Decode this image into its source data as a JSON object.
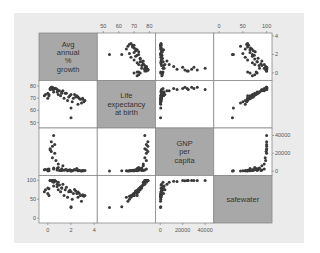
{
  "chart_data": {
    "type": "scatter",
    "subtype": "scatterplot-matrix",
    "title": "",
    "variables": [
      {
        "name": "Avg annual % growth",
        "label_lines": [
          "Avg",
          "annual",
          "%",
          "growth"
        ],
        "range": [
          -0.5,
          4
        ],
        "ticks": [
          0,
          2,
          4
        ]
      },
      {
        "name": "Life expectancy at birth",
        "label_lines": [
          "Life",
          "expectancy",
          "at birth"
        ],
        "range": [
          48,
          82
        ],
        "ticks": [
          50,
          60,
          70,
          80
        ]
      },
      {
        "name": "GNP per capita",
        "label_lines": [
          "GNP",
          "per",
          "capita"
        ],
        "range": [
          -1500,
          45000
        ],
        "ticks": [
          0,
          20000,
          40000
        ]
      },
      {
        "name": "safewater",
        "label_lines": [
          "safewater"
        ],
        "range": [
          -5,
          105
        ],
        "ticks": [
          0,
          50,
          100
        ]
      }
    ],
    "axes": {
      "top": [
        {
          "col": 1,
          "ticks": [
            "50",
            "60",
            "70",
            "80"
          ]
        },
        {
          "col": 3,
          "ticks": [
            "0",
            "50",
            "100"
          ]
        }
      ],
      "bottom": [
        {
          "col": 0,
          "ticks": [
            "0",
            "2",
            "4"
          ]
        },
        {
          "col": 2,
          "ticks": [
            "0",
            "20000",
            "40000"
          ]
        }
      ],
      "left": [
        {
          "row": 1,
          "ticks": [
            "80",
            "70",
            "60",
            "50"
          ]
        },
        {
          "row": 3,
          "ticks": [
            "100",
            "50",
            "0"
          ]
        }
      ],
      "right": [
        {
          "row": 0,
          "ticks": [
            "4",
            "2",
            "0"
          ]
        },
        {
          "row": 2,
          "ticks": [
            "40000",
            "20000",
            "0"
          ]
        }
      ]
    },
    "points": [
      [
        0.5,
        78,
        2500,
        95
      ],
      [
        0.8,
        77,
        1200,
        90
      ],
      [
        1.0,
        76,
        800,
        88
      ],
      [
        0.3,
        79,
        22000,
        99
      ],
      [
        0.6,
        78,
        30000,
        100
      ],
      [
        0.2,
        77,
        25000,
        100
      ],
      [
        0.4,
        79,
        28000,
        100
      ],
      [
        1.2,
        75,
        700,
        80
      ],
      [
        1.5,
        74,
        1500,
        75
      ],
      [
        2.0,
        73,
        1000,
        70
      ],
      [
        2.5,
        72,
        3000,
        65
      ],
      [
        3.0,
        70,
        400,
        60
      ],
      [
        2.8,
        69,
        600,
        60
      ],
      [
        2.2,
        70,
        900,
        65
      ],
      [
        1.8,
        71,
        1100,
        70
      ],
      [
        0.1,
        72,
        500,
        60
      ],
      [
        -0.2,
        73,
        1800,
        75
      ],
      [
        0.0,
        74,
        2200,
        80
      ],
      [
        0.5,
        75,
        3500,
        85
      ],
      [
        0.9,
        73,
        4200,
        75
      ],
      [
        1.1,
        72,
        700,
        70
      ],
      [
        1.4,
        70,
        900,
        60
      ],
      [
        1.7,
        68,
        600,
        55
      ],
      [
        2.1,
        67,
        500,
        50
      ],
      [
        2.6,
        65,
        400,
        55
      ],
      [
        2.9,
        66,
        300,
        45
      ],
      [
        3.2,
        68,
        800,
        60
      ],
      [
        2.0,
        62,
        500,
        30
      ],
      [
        2.0,
        54,
        300,
        28
      ],
      [
        1.3,
        76,
        6000,
        90
      ],
      [
        0.7,
        78,
        12000,
        98
      ],
      [
        0.4,
        77,
        15000,
        97
      ],
      [
        0.6,
        78,
        20000,
        100
      ],
      [
        0.2,
        78,
        24000,
        100
      ],
      [
        0.3,
        79,
        33000,
        100
      ],
      [
        0.5,
        77,
        40000,
        100
      ],
      [
        0.9,
        76,
        8000,
        95
      ],
      [
        1.6,
        74,
        2000,
        82
      ],
      [
        2.4,
        71,
        1200,
        72
      ],
      [
        2.7,
        70,
        900,
        66
      ],
      [
        3.0,
        69,
        700,
        62
      ],
      [
        3.1,
        67,
        600,
        58
      ],
      [
        0.0,
        70,
        500,
        65
      ],
      [
        -0.3,
        72,
        1500,
        70
      ],
      [
        0.1,
        73,
        2500,
        78
      ],
      [
        0.8,
        75,
        3000,
        84
      ],
      [
        1.2,
        74,
        2700,
        80
      ],
      [
        1.9,
        72,
        1600,
        74
      ],
      [
        2.3,
        73,
        1900,
        76
      ],
      [
        2.6,
        71,
        1100,
        69
      ]
    ],
    "marker": {
      "shape": "circle",
      "color": "#3a3a3a",
      "size": 3
    },
    "grid": false,
    "legend": null
  },
  "layout": {
    "frame_bg": "#ebebeb",
    "diag_bg": "#a8a8a8",
    "cell_bg": "#ffffff",
    "border": "#8a8a8a",
    "dot": "#3a3a3a"
  }
}
